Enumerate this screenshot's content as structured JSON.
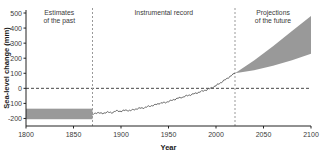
{
  "chart_data": {
    "type": "line",
    "title": "",
    "xlabel": "Year",
    "ylabel": "Sea-level change (mm)",
    "xlim": [
      1800,
      2100
    ],
    "ylim": [
      -250,
      520
    ],
    "xticks": [
      1800,
      1850,
      1900,
      1950,
      2000,
      2050,
      2100
    ],
    "yticks": [
      -200,
      -100,
      0,
      100,
      200,
      300,
      400,
      500
    ],
    "grid": false,
    "legend": null,
    "zero_reference_line": 0,
    "colors": {
      "band_gray": "#999999",
      "line": "#555555",
      "axis": "#222222",
      "dashed": "#333333",
      "divider": "#999999"
    },
    "regions": [
      {
        "name": "estimates-of-the-past",
        "label_line1": "Estimates",
        "label_line2": "of the past",
        "x_start": 1800,
        "x_end": 1870
      },
      {
        "name": "instrumental-record",
        "label_line1": "Instrumental record",
        "label_line2": "",
        "x_start": 1870,
        "x_end": 2020
      },
      {
        "name": "projections-of-the-future",
        "label_line1": "Projections",
        "label_line2": "of the future",
        "x_start": 2020,
        "x_end": 2100
      }
    ],
    "dividers": [
      1870,
      2020
    ],
    "series": [
      {
        "name": "paleo-estimate-band",
        "type": "band",
        "x": [
          1800,
          1870
        ],
        "y_lower": [
          -205,
          -205
        ],
        "y_upper": [
          -135,
          -135
        ]
      },
      {
        "name": "instrumental-record-line",
        "type": "line",
        "x": [
          1870,
          1875,
          1880,
          1885,
          1890,
          1895,
          1900,
          1905,
          1910,
          1915,
          1920,
          1925,
          1930,
          1935,
          1940,
          1945,
          1950,
          1955,
          1960,
          1965,
          1970,
          1975,
          1980,
          1985,
          1990,
          1995,
          2000,
          2005,
          2010,
          2015,
          2020
        ],
        "y": [
          -175,
          -160,
          -168,
          -158,
          -162,
          -150,
          -152,
          -145,
          -148,
          -138,
          -132,
          -128,
          -118,
          -112,
          -100,
          -96,
          -88,
          -76,
          -66,
          -58,
          -48,
          -40,
          -30,
          -20,
          -10,
          2,
          18,
          38,
          58,
          80,
          100
        ]
      },
      {
        "name": "projection-band",
        "type": "band",
        "x": [
          2020,
          2040,
          2060,
          2080,
          2100
        ],
        "y_lower": [
          100,
          120,
          150,
          186,
          230
        ],
        "y_upper": [
          100,
          185,
          280,
          380,
          480
        ]
      }
    ]
  }
}
